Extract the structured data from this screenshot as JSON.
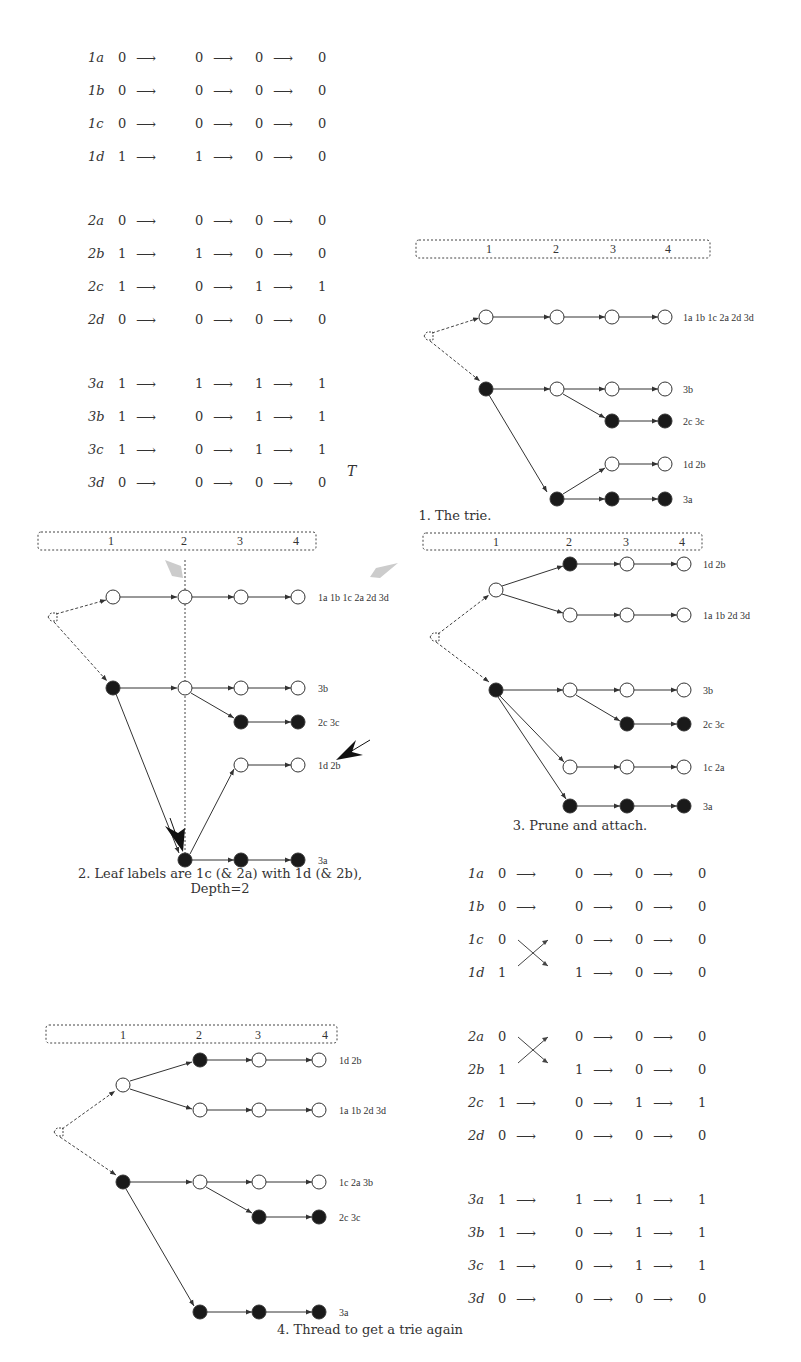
{
  "header_fragment": "... threading to get a trie to represent the hypothesis ...",
  "tables": {
    "top_left": {
      "groups": [
        {
          "rows": [
            {
              "label": "1a",
              "values": [
                "0",
                "0",
                "0",
                "0"
              ]
            },
            {
              "label": "1b",
              "values": [
                "0",
                "0",
                "0",
                "0"
              ]
            },
            {
              "label": "1c",
              "values": [
                "0",
                "0",
                "0",
                "0"
              ]
            },
            {
              "label": "1d",
              "values": [
                "1",
                "1",
                "0",
                "0"
              ]
            }
          ]
        },
        {
          "rows": [
            {
              "label": "2a",
              "values": [
                "0",
                "0",
                "0",
                "0"
              ]
            },
            {
              "label": "2b",
              "values": [
                "1",
                "1",
                "0",
                "0"
              ]
            },
            {
              "label": "2c",
              "values": [
                "1",
                "0",
                "1",
                "1"
              ]
            },
            {
              "label": "2d",
              "values": [
                "0",
                "0",
                "0",
                "0"
              ]
            }
          ]
        },
        {
          "rows": [
            {
              "label": "3a",
              "values": [
                "1",
                "1",
                "1",
                "1"
              ]
            },
            {
              "label": "3b",
              "values": [
                "1",
                "0",
                "1",
                "1"
              ]
            },
            {
              "label": "3c",
              "values": [
                "1",
                "0",
                "1",
                "1"
              ]
            },
            {
              "label": "3d",
              "values": [
                "0",
                "0",
                "0",
                "0"
              ]
            }
          ]
        }
      ],
      "symbol": "T"
    },
    "bottom_right": {
      "groups": [
        {
          "rows": [
            {
              "label": "1a",
              "values": [
                "0",
                "0",
                "0",
                "0"
              ]
            },
            {
              "label": "1b",
              "values": [
                "0",
                "0",
                "0",
                "0"
              ]
            },
            {
              "label": "1c",
              "values": [
                "0",
                "0",
                "0",
                "0"
              ],
              "crossed": true
            },
            {
              "label": "1d",
              "values": [
                "1",
                "1",
                "0",
                "0"
              ],
              "crossed": true
            }
          ]
        },
        {
          "rows": [
            {
              "label": "2a",
              "values": [
                "0",
                "0",
                "0",
                "0"
              ],
              "crossed": true
            },
            {
              "label": "2b",
              "values": [
                "1",
                "1",
                "0",
                "0"
              ],
              "crossed": true
            },
            {
              "label": "2c",
              "values": [
                "1",
                "0",
                "1",
                "1"
              ]
            },
            {
              "label": "2d",
              "values": [
                "0",
                "0",
                "0",
                "0"
              ]
            }
          ]
        },
        {
          "rows": [
            {
              "label": "3a",
              "values": [
                "1",
                "1",
                "1",
                "1"
              ]
            },
            {
              "label": "3b",
              "values": [
                "1",
                "0",
                "1",
                "1"
              ]
            },
            {
              "label": "3c",
              "values": [
                "1",
                "0",
                "1",
                "1"
              ]
            },
            {
              "label": "3d",
              "values": [
                "0",
                "0",
                "0",
                "0"
              ]
            }
          ]
        }
      ]
    }
  },
  "arrow_glyph": "⟶",
  "level_header": [
    "1",
    "2",
    "3",
    "4"
  ],
  "panels": {
    "p1": {
      "caption": "1. The trie.",
      "leaves": [
        "1a 1b 1c 2a 2d 3d",
        "3b",
        "2c 3c",
        "1d 2b",
        "3a"
      ]
    },
    "p2": {
      "caption_line1": "2. Leaf labels are 1c (& 2a) with 1d (& 2b),",
      "caption_line2": "Depth=2",
      "leaves": [
        "1a 1b 1c 2a 2d 3d",
        "3b",
        "2c 3c",
        "1d 2b",
        "3a"
      ]
    },
    "p3": {
      "caption": "3. Prune and attach.",
      "leaves": [
        "1d 2b",
        "1a 1b 2d 3d",
        "3b",
        "2c 3c",
        "1c 2a",
        "3a"
      ]
    },
    "p4": {
      "caption": "4. Thread to get a trie again",
      "leaves": [
        "1d 2b",
        "1a 1b 2d 3d",
        "1c 2a 3b",
        "2c 3c",
        "3a"
      ]
    }
  },
  "colors": {
    "ink": "#333333",
    "filled_node": "#1a1a1a",
    "highlight_arrow": "#cccccc",
    "pointer_arrow": "#111111"
  }
}
